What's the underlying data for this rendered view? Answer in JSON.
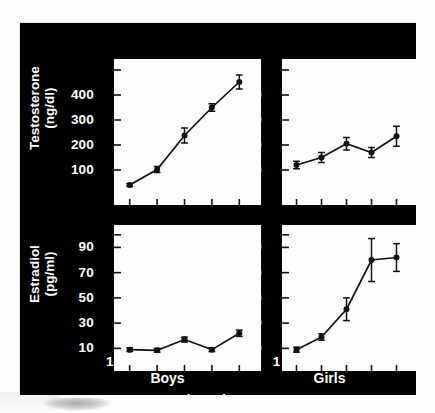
{
  "figure": {
    "xlabel": "Pubertal stage",
    "group_labels": [
      "Boys",
      "Girls"
    ],
    "x_tick_labels": [
      "1",
      "2",
      "3",
      "4",
      "5"
    ],
    "background_color": "#000000",
    "panel_color": "#fdfdfd",
    "ink_color": "#ffffff"
  },
  "chart_data": [
    {
      "id": "boys-testosterone",
      "type": "line",
      "title": "",
      "group": "Boys",
      "xlabel": "Pubertal stage",
      "ylabel": "Testosterone (ng/dl)",
      "ylabel_lines": [
        "Testosterone",
        "(ng/dl)"
      ],
      "x": [
        1,
        2,
        3,
        4,
        5
      ],
      "categories": [
        "1",
        "2",
        "3",
        "4",
        "5"
      ],
      "values": [
        40,
        102,
        238,
        350,
        452
      ],
      "errors": [
        6,
        12,
        30,
        15,
        28
      ],
      "ylim": [
        0,
        520
      ],
      "yticks": [
        100,
        200,
        300,
        400,
        500
      ],
      "ytick_labels": [
        "100",
        "200",
        "300",
        "400",
        ""
      ],
      "xlim": [
        0.5,
        5.5
      ],
      "grid": false,
      "legend": "none",
      "marker": "filled-circle",
      "units": "ng/dl"
    },
    {
      "id": "girls-testosterone",
      "type": "line",
      "title": "",
      "group": "Girls",
      "xlabel": "Pubertal stage",
      "ylabel": "Testosterone (ng/dl)",
      "ylabel_lines": [
        "Testosterone",
        "(ng/dl)"
      ],
      "x": [
        1,
        2,
        3,
        4,
        5
      ],
      "categories": [
        "1",
        "2",
        "3",
        "4",
        "5"
      ],
      "values": [
        12,
        15,
        20.5,
        17,
        23.5
      ],
      "errors": [
        1.5,
        2,
        2.5,
        2,
        4
      ],
      "ylim": [
        0,
        52
      ],
      "yticks": [
        10,
        20,
        30,
        40,
        50
      ],
      "ytick_labels": [
        "10",
        "20",
        "30",
        "40",
        ""
      ],
      "xlim": [
        0.5,
        5.5
      ],
      "grid": false,
      "legend": "none",
      "marker": "filled-circle",
      "units": "ng/dl"
    },
    {
      "id": "boys-estradiol",
      "type": "line",
      "title": "",
      "group": "Boys",
      "xlabel": "Pubertal stage",
      "ylabel": "Estradiol (pg/ml)",
      "ylabel_lines": [
        "Estradiol",
        "(pg/ml)"
      ],
      "x": [
        1,
        2,
        3,
        4,
        5
      ],
      "categories": [
        "1",
        "2",
        "3",
        "4",
        "5"
      ],
      "values": [
        9,
        8.5,
        17,
        9,
        22
      ],
      "errors": [
        1.5,
        1.5,
        2,
        1.5,
        2.5
      ],
      "ylim": [
        0,
        103
      ],
      "yticks": [
        10,
        30,
        50,
        70,
        90,
        100
      ],
      "ytick_labels": [
        "10",
        "30",
        "50",
        "70",
        "90",
        ""
      ],
      "xlim": [
        0.5,
        5.5
      ],
      "grid": false,
      "legend": "none",
      "marker": "filled-circle",
      "units": "pg/ml"
    },
    {
      "id": "girls-estradiol",
      "type": "line",
      "title": "",
      "group": "Girls",
      "xlabel": "Pubertal stage",
      "ylabel": "Estradiol (pg/ml)",
      "ylabel_lines": [
        "Estradiol",
        "(pg/ml)"
      ],
      "x": [
        1,
        2,
        3,
        4,
        5
      ],
      "categories": [
        "1",
        "2",
        "3",
        "4",
        "5"
      ],
      "values": [
        9,
        19,
        41,
        80,
        82
      ],
      "errors": [
        2,
        2.5,
        9,
        17,
        11
      ],
      "ylim": [
        0,
        103
      ],
      "yticks": [
        10,
        30,
        50,
        70,
        90,
        100
      ],
      "ytick_labels": [
        "10",
        "30",
        "50",
        "70",
        "90",
        ""
      ],
      "xlim": [
        0.5,
        5.5
      ],
      "grid": false,
      "legend": "none",
      "marker": "filled-circle",
      "units": "pg/ml"
    }
  ]
}
